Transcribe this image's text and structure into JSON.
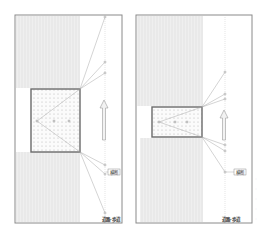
{
  "figure": {
    "panels": [
      {
        "id": "left",
        "frame": {
          "x": 15,
          "y": 15,
          "w": 107,
          "h": 208
        },
        "hatch_regions": [
          {
            "x": 16,
            "y": 16,
            "w": 64,
            "h": 72
          },
          {
            "x": 16,
            "y": 152,
            "w": 64,
            "h": 70
          }
        ],
        "dotted_box": {
          "x": 31,
          "y": 89,
          "w": 49,
          "h": 63
        },
        "vertical_line_x": 105,
        "origin_points": [
          {
            "x": 37,
            "y": 121
          },
          {
            "x": 54,
            "y": 121
          },
          {
            "x": 69,
            "y": 121
          }
        ],
        "target_points": [
          {
            "x": 105,
            "y": 17
          },
          {
            "x": 105,
            "y": 62
          },
          {
            "x": 105,
            "y": 73
          },
          {
            "x": 105,
            "y": 165
          },
          {
            "x": 105,
            "y": 174
          },
          {
            "x": 105,
            "y": 213
          }
        ],
        "arrow": {
          "x": 104,
          "y_top": 100,
          "y_bottom": 140
        },
        "tag_label": "横断",
        "tag_pos": {
          "x": 114,
          "y": 172
        },
        "footer_label": "道路·歩道",
        "footer_pos": {
          "x": 102,
          "y": 221
        }
      },
      {
        "id": "right",
        "frame": {
          "x": 136,
          "y": 15,
          "w": 116,
          "h": 208
        },
        "hatch_regions": [
          {
            "x": 137,
            "y": 16,
            "w": 66,
            "h": 90
          },
          {
            "x": 140,
            "y": 138,
            "w": 63,
            "h": 84
          }
        ],
        "dotted_box": {
          "x": 152,
          "y": 107,
          "w": 50,
          "h": 30
        },
        "vertical_line_x": 225,
        "origin_points": [
          {
            "x": 159,
            "y": 122
          },
          {
            "x": 175,
            "y": 122
          },
          {
            "x": 187,
            "y": 122
          }
        ],
        "target_points": [
          {
            "x": 225,
            "y": 72
          },
          {
            "x": 225,
            "y": 94
          },
          {
            "x": 225,
            "y": 99
          },
          {
            "x": 225,
            "y": 145
          },
          {
            "x": 225,
            "y": 151
          },
          {
            "x": 225,
            "y": 172
          }
        ],
        "arrow": {
          "x": 224,
          "y_top": 110,
          "y_bottom": 140
        },
        "tag_label": "横断",
        "tag_pos": {
          "x": 240,
          "y": 172
        },
        "footer_label": "道路·歩道",
        "footer_pos": {
          "x": 222,
          "y": 221
        }
      }
    ],
    "side_marks": [
      ":",
      "·",
      ":",
      "·",
      ":"
    ],
    "colors": {
      "frame": "#8a8a8a",
      "box_border": "#6a6a6a",
      "hatch": "#e6e6e6",
      "dot": "#b5b5b5",
      "line": "#a8a8a8",
      "arrow": "#9a9a9a"
    }
  }
}
